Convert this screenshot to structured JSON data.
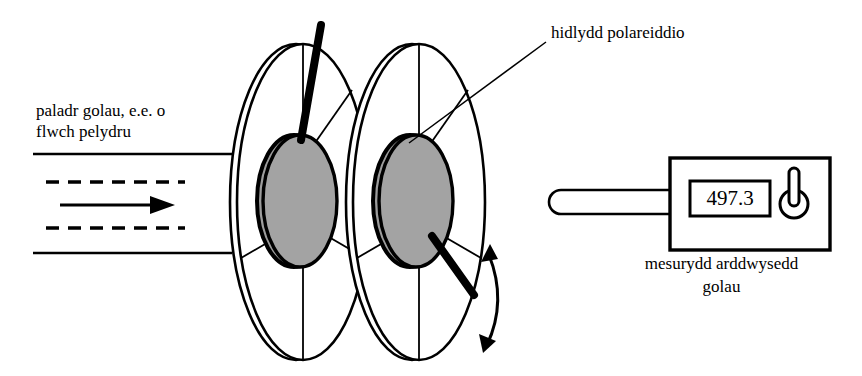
{
  "diagram": {
    "language": "cy",
    "labels": {
      "beam_source": "paladr golau, e.e. o\nflwch pelydru",
      "polarising_filter": "hidlydd polareiddio",
      "meter_caption": "mesurydd arddwysedd\ngolau"
    },
    "meter": {
      "display_value": "497.3",
      "knob_icon": "power-knob-icon",
      "probe_icon": "probe-bar-icon"
    },
    "components": {
      "filter_one": "first-polarising-filter",
      "filter_two": "second-polarising-filter",
      "handle_one": "first-filter-handle",
      "handle_two": "second-filter-handle",
      "rotation_arrow": "rotation-double-arrow",
      "beam_arrow": "light-beam-direction-arrow"
    },
    "colors": {
      "stroke": "#000000",
      "filter_fill": "#a3a3a3",
      "background": "#ffffff"
    }
  }
}
